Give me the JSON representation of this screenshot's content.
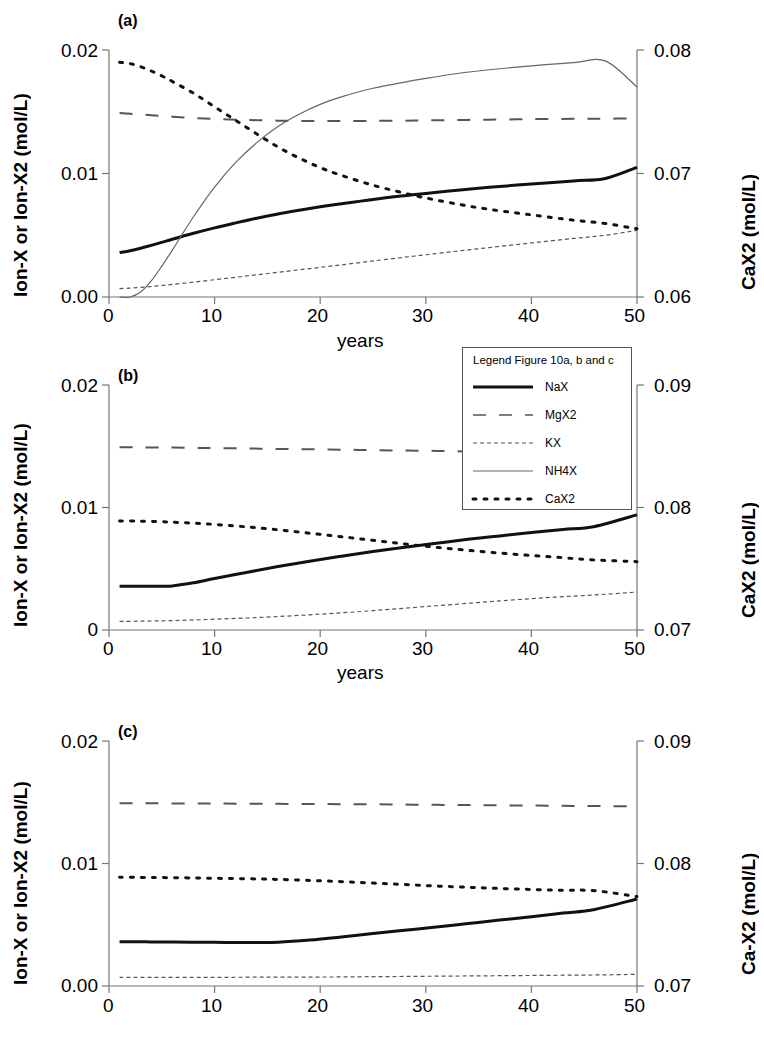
{
  "figure": {
    "legend": {
      "title": "Legend Figure 10a, b and c",
      "entries": [
        {
          "label": "NaX",
          "style": "solid-thick"
        },
        {
          "label": "MgX2",
          "style": "long-dash"
        },
        {
          "label": "KX",
          "style": "fine-dash"
        },
        {
          "label": "NH4X",
          "style": "solid-thin"
        },
        {
          "label": "CaX2",
          "style": "dotted"
        }
      ]
    },
    "panels": [
      {
        "tag": "(a)",
        "xlabel": "years",
        "ylabel_left": "Ion-X or Ion-X2 (mol/L)",
        "ylabel_right": "CaX2 (mol/L)",
        "xticks": [
          "0",
          "10",
          "20",
          "30",
          "40",
          "50"
        ],
        "yticks_left": [
          "0.00",
          "0.01",
          "0.02"
        ],
        "yticks_right": [
          "0.06",
          "0.07",
          "0.08"
        ]
      },
      {
        "tag": "(b)",
        "xlabel": "years",
        "ylabel_left": "Ion-X or Ion-X2 (mol/L)",
        "ylabel_right": "CaX2 (mol/L)",
        "xticks": [
          "0",
          "10",
          "20",
          "30",
          "40",
          "50"
        ],
        "yticks_left": [
          "0",
          "0.01",
          "0.02"
        ],
        "yticks_right": [
          "0.07",
          "0.08",
          "0.09"
        ]
      },
      {
        "tag": "(c)",
        "xlabel": "",
        "ylabel_left": "Ion-X or Ion-X2 (mol/L)",
        "ylabel_right": "Ca-X2 (mol/L)",
        "xticks": [
          "0",
          "10",
          "20",
          "30",
          "40",
          "50"
        ],
        "yticks_left": [
          "0.00",
          "0.01",
          "0.02"
        ],
        "yticks_right": [
          "0.07",
          "0.08",
          "0.09"
        ]
      }
    ]
  },
  "chart_data": [
    {
      "type": "line",
      "title": "(a)",
      "xlabel": "years",
      "ylabel": "Ion-X or Ion-X2 (mol/L)",
      "ylabel_secondary": "CaX2 (mol/L)",
      "xlim": [
        0,
        50
      ],
      "ylim": [
        0.0,
        0.02
      ],
      "ylim_secondary": [
        0.06,
        0.08
      ],
      "grid": false,
      "legend_position": "below-right",
      "x": [
        1,
        2,
        3,
        4,
        5,
        6,
        8,
        10,
        12,
        14,
        16,
        18,
        20,
        22,
        25,
        28,
        30,
        33,
        36,
        40,
        44,
        47,
        50
      ],
      "series": [
        {
          "name": "NaX",
          "style": "solid-thick",
          "axis": "left",
          "values": [
            0.0036,
            0.00375,
            0.00395,
            0.00418,
            0.00442,
            0.00468,
            0.00516,
            0.0056,
            0.006,
            0.00638,
            0.00672,
            0.00702,
            0.0073,
            0.00755,
            0.0079,
            0.0082,
            0.00838,
            0.00865,
            0.00888,
            0.00915,
            0.0094,
            0.0096,
            0.0105
          ]
        },
        {
          "name": "MgX2",
          "style": "long-dash",
          "axis": "left",
          "values": [
            0.0149,
            0.01484,
            0.01478,
            0.01472,
            0.01466,
            0.0146,
            0.0145,
            0.01442,
            0.01436,
            0.01432,
            0.01428,
            0.01426,
            0.01425,
            0.01425,
            0.01426,
            0.01428,
            0.0143,
            0.01433,
            0.01436,
            0.0144,
            0.01443,
            0.01444,
            0.01445
          ]
        },
        {
          "name": "KX",
          "style": "fine-dash",
          "axis": "left",
          "values": [
            0.00068,
            0.00072,
            0.00078,
            0.00085,
            0.00093,
            0.00102,
            0.0012,
            0.0014,
            0.0016,
            0.0018,
            0.002,
            0.0022,
            0.0024,
            0.0026,
            0.00292,
            0.00322,
            0.00342,
            0.00372,
            0.004,
            0.00438,
            0.00474,
            0.005,
            0.0054
          ]
        },
        {
          "name": "NH4X",
          "style": "solid-thin",
          "axis": "left",
          "values": [
            0.0,
            0.0,
            0.0004,
            0.0013,
            0.0025,
            0.0038,
            0.0065,
            0.0089,
            0.0109,
            0.0125,
            0.0138,
            0.0148,
            0.0156,
            0.0162,
            0.0169,
            0.0174,
            0.0177,
            0.0181,
            0.0184,
            0.01872,
            0.01898,
            0.01912,
            0.017
          ]
        },
        {
          "name": "CaX2",
          "style": "dotted",
          "axis": "right",
          "right_values": [
            0.0795,
            0.0794,
            0.0792,
            0.079,
            0.0787,
            0.0784,
            0.0777,
            0.0768,
            0.0758,
            0.0748,
            0.0738,
            0.0729,
            0.0721,
            0.0714,
            0.0705,
            0.0697,
            0.0692,
            0.0685,
            0.0679,
            0.0672,
            0.0666,
            0.0662,
            0.0655
          ],
          "values": [
            0.019,
            0.0189,
            0.01865,
            0.0183,
            0.0179,
            0.01745,
            0.0165,
            0.0154,
            0.0143,
            0.0132,
            0.01215,
            0.01125,
            0.01048,
            0.00985,
            0.00905,
            0.0084,
            0.00802,
            0.00752,
            0.0071,
            0.00665,
            0.00622,
            0.00595,
            0.00552
          ]
        }
      ]
    },
    {
      "type": "line",
      "title": "(b)",
      "xlabel": "years",
      "ylabel": "Ion-X or Ion-X2 (mol/L)",
      "ylabel_secondary": "CaX2 (mol/L)",
      "xlim": [
        0,
        50
      ],
      "ylim": [
        0.0,
        0.02
      ],
      "ylim_secondary": [
        0.07,
        0.09
      ],
      "grid": false,
      "legend_position": "above-right",
      "x": [
        1,
        3,
        5,
        6,
        8,
        10,
        13,
        16,
        19,
        22,
        25,
        28,
        31,
        34,
        37,
        40,
        43,
        46,
        50
      ],
      "series": [
        {
          "name": "NaX",
          "style": "solid-thick",
          "axis": "left",
          "values": [
            0.00358,
            0.00358,
            0.00358,
            0.0036,
            0.00385,
            0.0042,
            0.0047,
            0.00518,
            0.00562,
            0.00602,
            0.0064,
            0.00675,
            0.00708,
            0.0074,
            0.00768,
            0.00795,
            0.0082,
            0.00845,
            0.0094
          ]
        },
        {
          "name": "MgX2",
          "style": "long-dash",
          "axis": "left",
          "values": [
            0.01492,
            0.01491,
            0.0149,
            0.01489,
            0.01487,
            0.01485,
            0.01482,
            0.01478,
            0.01475,
            0.01472,
            0.01468,
            0.01465,
            0.01462,
            0.01458,
            0.01455,
            0.01452,
            0.01449,
            0.01446,
            0.01442
          ]
        },
        {
          "name": "KX",
          "style": "fine-dash",
          "axis": "left",
          "values": [
            0.0007,
            0.00072,
            0.00075,
            0.00077,
            0.00082,
            0.00088,
            0.00098,
            0.0011,
            0.00124,
            0.0014,
            0.00158,
            0.00178,
            0.00198,
            0.00218,
            0.00238,
            0.00256,
            0.00272,
            0.00286,
            0.0031
          ]
        },
        {
          "name": "CaX2",
          "style": "dotted",
          "axis": "right",
          "right_values": [
            0.0789,
            0.0789,
            0.0788,
            0.0788,
            0.0787,
            0.0786,
            0.0784,
            0.0781,
            0.0778,
            0.0775,
            0.0771,
            0.0767,
            0.0763,
            0.076,
            0.0757,
            0.0754,
            0.0751,
            0.0748,
            0.0745
          ],
          "values": [
            0.0089,
            0.00888,
            0.00884,
            0.0088,
            0.00872,
            0.00862,
            0.00842,
            0.00818,
            0.0079,
            0.00762,
            0.00732,
            0.00702,
            0.00675,
            0.0065,
            0.00628,
            0.00608,
            0.0059,
            0.00572,
            0.00558
          ]
        }
      ]
    },
    {
      "type": "line",
      "title": "(c)",
      "xlabel": "",
      "ylabel": "Ion-X or Ion-X2 (mol/L)",
      "ylabel_secondary": "Ca-X2 (mol/L)",
      "xlim": [
        0,
        50
      ],
      "ylim": [
        0.0,
        0.02
      ],
      "ylim_secondary": [
        0.07,
        0.09
      ],
      "grid": false,
      "legend_position": "shared",
      "x": [
        1,
        4,
        8,
        11,
        14,
        16,
        19,
        22,
        25,
        28,
        31,
        34,
        37,
        40,
        43,
        46,
        50
      ],
      "series": [
        {
          "name": "NaX",
          "style": "solid-thick",
          "axis": "left",
          "values": [
            0.00362,
            0.0036,
            0.00358,
            0.00356,
            0.00356,
            0.00358,
            0.00375,
            0.004,
            0.00428,
            0.00455,
            0.00482,
            0.0051,
            0.00538,
            0.00565,
            0.00595,
            0.00625,
            0.0071
          ]
        },
        {
          "name": "MgX2",
          "style": "long-dash",
          "axis": "left",
          "values": [
            0.01492,
            0.01491,
            0.0149,
            0.01489,
            0.01488,
            0.01487,
            0.01486,
            0.01484,
            0.01483,
            0.01481,
            0.01479,
            0.01477,
            0.01475,
            0.01473,
            0.01471,
            0.01469,
            0.01466
          ]
        },
        {
          "name": "KX",
          "style": "fine-dash",
          "axis": "left",
          "values": [
            0.0007,
            0.0007,
            0.00071,
            0.00071,
            0.00072,
            0.00072,
            0.00073,
            0.00074,
            0.00076,
            0.00078,
            0.0008,
            0.00082,
            0.00084,
            0.00086,
            0.00088,
            0.0009,
            0.00095
          ]
        },
        {
          "name": "CaX2",
          "style": "dotted",
          "axis": "right",
          "right_values": [
            0.0789,
            0.0789,
            0.0788,
            0.0788,
            0.0787,
            0.0787,
            0.0786,
            0.0785,
            0.0783,
            0.0782,
            0.078,
            0.0779,
            0.0777,
            0.0776,
            0.0775,
            0.0774,
            0.0773
          ],
          "values": [
            0.00888,
            0.00886,
            0.00882,
            0.00878,
            0.00874,
            0.0087,
            0.00862,
            0.00852,
            0.0084,
            0.00828,
            0.00816,
            0.00806,
            0.00796,
            0.00788,
            0.00782,
            0.00778,
            0.0073
          ]
        }
      ]
    }
  ]
}
